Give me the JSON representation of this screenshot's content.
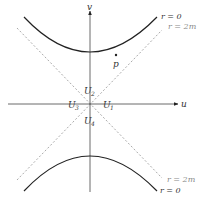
{
  "diagram": {
    "axes": {
      "horizontal_label": "u",
      "vertical_label": "v"
    },
    "regions": {
      "right": {
        "label": "U",
        "sub": "1"
      },
      "top": {
        "label": "U",
        "sub": "2"
      },
      "left": {
        "label": "U",
        "sub": "3"
      },
      "bottom": {
        "label": "U",
        "sub": "4"
      }
    },
    "curves": {
      "singularity_top": "r = 0",
      "horizon_top": "r = 2m",
      "horizon_bottom": "r = 2m",
      "singularity_bottom": "r = 0"
    },
    "point": {
      "label": "p"
    },
    "colors": {
      "curve": "#222222",
      "axis": "#444444",
      "dashed": "#aaaaaa",
      "label_gray": "#888888"
    }
  }
}
